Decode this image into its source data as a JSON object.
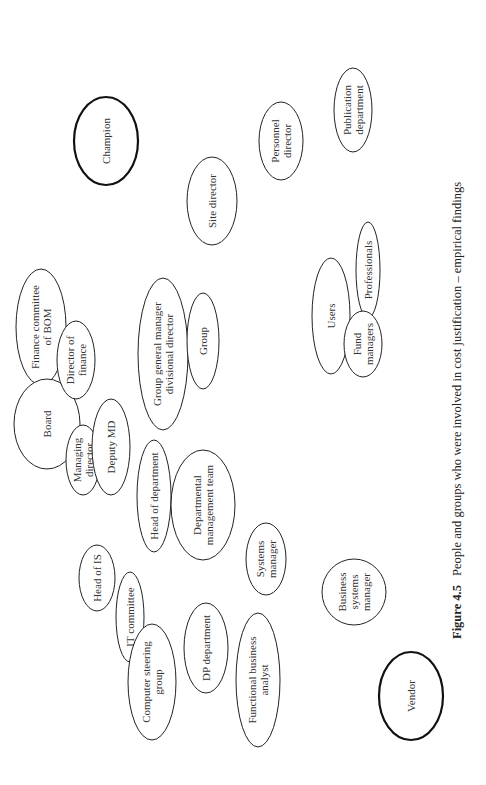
{
  "figure": {
    "caption_label": "Figure 4.5",
    "caption_text": "People and groups who were involved in cost justification – empirical  findings",
    "orientation": "rotated-90-ccw"
  },
  "nodes": [
    {
      "id": "champion",
      "lines": [
        "Champion"
      ],
      "cx": 106,
      "cy": 141,
      "rx": 32,
      "ry": 44,
      "bold": true
    },
    {
      "id": "site-director",
      "lines": [
        "Site director"
      ],
      "cx": 212,
      "cy": 201,
      "rx": 25,
      "ry": 44,
      "bold": false
    },
    {
      "id": "personnel-director",
      "lines": [
        "Personnel",
        "director"
      ],
      "cx": 281,
      "cy": 141,
      "rx": 22,
      "ry": 39,
      "bold": false
    },
    {
      "id": "publication-department",
      "lines": [
        "Publication",
        "department"
      ],
      "cx": 353,
      "cy": 110,
      "rx": 19,
      "ry": 42,
      "bold": false
    },
    {
      "id": "finance-committee",
      "lines": [
        "Finance committee",
        "of BOM"
      ],
      "cx": 41,
      "cy": 327,
      "rx": 25,
      "ry": 58,
      "bold": false
    },
    {
      "id": "board",
      "lines": [
        "Board"
      ],
      "cx": 47,
      "cy": 424,
      "rx": 33,
      "ry": 45,
      "bold": false
    },
    {
      "id": "director-of-finance",
      "lines": [
        "Director of",
        "finance"
      ],
      "cx": 76,
      "cy": 360,
      "rx": 19,
      "ry": 39,
      "bold": false
    },
    {
      "id": "managing-director",
      "lines": [
        "Managing",
        "director"
      ],
      "cx": 83,
      "cy": 460,
      "rx": 17,
      "ry": 35,
      "bold": false
    },
    {
      "id": "deputy-md",
      "lines": [
        "Deputy MD"
      ],
      "cx": 111,
      "cy": 447,
      "rx": 19,
      "ry": 48,
      "bold": false
    },
    {
      "id": "group-general-manager",
      "lines": [
        "Group general manager",
        "divisional director"
      ],
      "cx": 163,
      "cy": 354,
      "rx": 25,
      "ry": 76,
      "bold": false
    },
    {
      "id": "group",
      "lines": [
        "Group"
      ],
      "cx": 203,
      "cy": 341,
      "rx": 16,
      "ry": 48,
      "bold": false
    },
    {
      "id": "head-of-department",
      "lines": [
        "Head of department"
      ],
      "cx": 154,
      "cy": 496,
      "rx": 17,
      "ry": 56,
      "bold": false
    },
    {
      "id": "departmental-management-team",
      "lines": [
        "Departmental",
        "management team"
      ],
      "cx": 203,
      "cy": 505,
      "rx": 32,
      "ry": 55,
      "bold": false
    },
    {
      "id": "users",
      "lines": [
        "Users"
      ],
      "cx": 331,
      "cy": 316,
      "rx": 19,
      "ry": 58,
      "bold": false
    },
    {
      "id": "professionals",
      "lines": [
        "Professionals"
      ],
      "cx": 368,
      "cy": 270,
      "rx": 12,
      "ry": 48,
      "bold": false
    },
    {
      "id": "fund-managers",
      "lines": [
        "Fund",
        "managers"
      ],
      "cx": 363,
      "cy": 344,
      "rx": 19,
      "ry": 33,
      "bold": false
    },
    {
      "id": "head-of-is",
      "lines": [
        "Head of IS"
      ],
      "cx": 97,
      "cy": 578,
      "rx": 18,
      "ry": 33,
      "bold": false
    },
    {
      "id": "it-committee",
      "lines": [
        "IT committee"
      ],
      "cx": 130,
      "cy": 617,
      "rx": 14,
      "ry": 45,
      "bold": false
    },
    {
      "id": "computer-steering-group",
      "lines": [
        "Computer steering",
        "group"
      ],
      "cx": 152,
      "cy": 682,
      "rx": 24,
      "ry": 58,
      "bold": false
    },
    {
      "id": "dp-department",
      "lines": [
        "DP department"
      ],
      "cx": 206,
      "cy": 648,
      "rx": 22,
      "ry": 45,
      "bold": false
    },
    {
      "id": "functional-business-analyst",
      "lines": [
        "Functional business",
        "analyst"
      ],
      "cx": 258,
      "cy": 680,
      "rx": 22,
      "ry": 67,
      "bold": false
    },
    {
      "id": "systems-manager",
      "lines": [
        "Systems",
        "manager"
      ],
      "cx": 266,
      "cy": 559,
      "rx": 20,
      "ry": 36,
      "bold": false
    },
    {
      "id": "business-systems-manager",
      "lines": [
        "Business",
        "systems",
        "manager"
      ],
      "cx": 354,
      "cy": 592,
      "rx": 32,
      "ry": 33,
      "bold": false
    },
    {
      "id": "vendor",
      "lines": [
        "Vendor"
      ],
      "cx": 411,
      "cy": 696,
      "rx": 32,
      "ry": 44,
      "bold": true
    }
  ]
}
